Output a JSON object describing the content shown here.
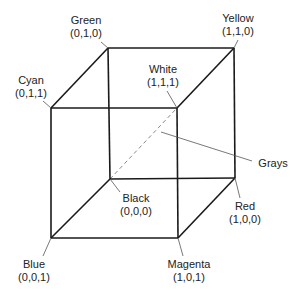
{
  "diagram": {
    "vertices": [
      {
        "id": "green",
        "name": "Green",
        "coord": "(0,1,0)",
        "x": 108,
        "y": 48,
        "label_x": 86,
        "label_y": 14
      },
      {
        "id": "yellow",
        "name": "Yellow",
        "coord": "(1,1,0)",
        "x": 234,
        "y": 48,
        "label_x": 238,
        "label_y": 14
      },
      {
        "id": "cyan",
        "name": "Cyan",
        "coord": "(0,1,1)",
        "x": 51,
        "y": 108,
        "label_x": 31,
        "label_y": 74
      },
      {
        "id": "white",
        "name": "White",
        "coord": "(1,1,1)",
        "x": 177,
        "y": 108,
        "label_x": 165,
        "label_y": 63
      },
      {
        "id": "black",
        "name": "Black",
        "coord": "(0,0,0)",
        "x": 110,
        "y": 179,
        "label_x": 133,
        "label_y": 194
      },
      {
        "id": "red",
        "name": "Red",
        "coord": "(1,0,0)",
        "x": 235,
        "y": 178,
        "label_x": 245,
        "label_y": 202
      },
      {
        "id": "blue",
        "name": "Blue",
        "coord": "(0,0,1)",
        "x": 51,
        "y": 238,
        "label_x": 33,
        "label_y": 258
      },
      {
        "id": "magenta",
        "name": "Magenta",
        "coord": "(1,0,1)",
        "x": 178,
        "y": 238,
        "label_x": 190,
        "label_y": 258
      }
    ],
    "annotation": {
      "name": "Grays",
      "x": 255,
      "y": 157
    },
    "edge_color": "#1a1a1a",
    "diagonal_color": "#888888"
  },
  "labels": {
    "green": {
      "name": "Green",
      "coord": "(0,1,0)"
    },
    "yellow": {
      "name": "Yellow",
      "coord": "(1,1,0)"
    },
    "cyan": {
      "name": "Cyan",
      "coord": "(0,1,1)"
    },
    "white": {
      "name": "White",
      "coord": "(1,1,1)"
    },
    "black": {
      "name": "Black",
      "coord": "(0,0,0)"
    },
    "red": {
      "name": "Red",
      "coord": "(1,0,0)"
    },
    "blue": {
      "name": "Blue",
      "coord": "(0,0,1)"
    },
    "magenta": {
      "name": "Magenta",
      "coord": "(1,0,1)"
    },
    "grays": "Grays"
  }
}
